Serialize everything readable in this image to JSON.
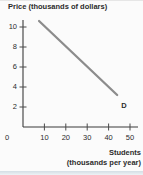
{
  "colors": {
    "background": "#fbfbfb",
    "axis": "#3b3b3b",
    "tick": "#4a4a4a",
    "text": "#2b2b2b",
    "curve": "#8c8c8c",
    "footer_band": "#d4dee5"
  },
  "chart_data": {
    "type": "line",
    "title": "",
    "ylabel": "Price (thousands of dollars)",
    "xlabel": "Students (thousands per year)",
    "xlabel_line1": "Students",
    "xlabel_line2": "(thousands per year)",
    "origin_label": "0",
    "x_ticks": [
      10,
      20,
      30,
      40,
      50
    ],
    "y_ticks": [
      2,
      4,
      6,
      8,
      10
    ],
    "xlim": [
      0,
      54
    ],
    "ylim": [
      0,
      10.7
    ],
    "grid": false,
    "legend": "none",
    "series": [
      {
        "name": "Demand",
        "label": "D",
        "points": [
          {
            "x": 7.5,
            "y": 10.6
          },
          {
            "x": 44,
            "y": 3.2
          }
        ]
      }
    ]
  }
}
